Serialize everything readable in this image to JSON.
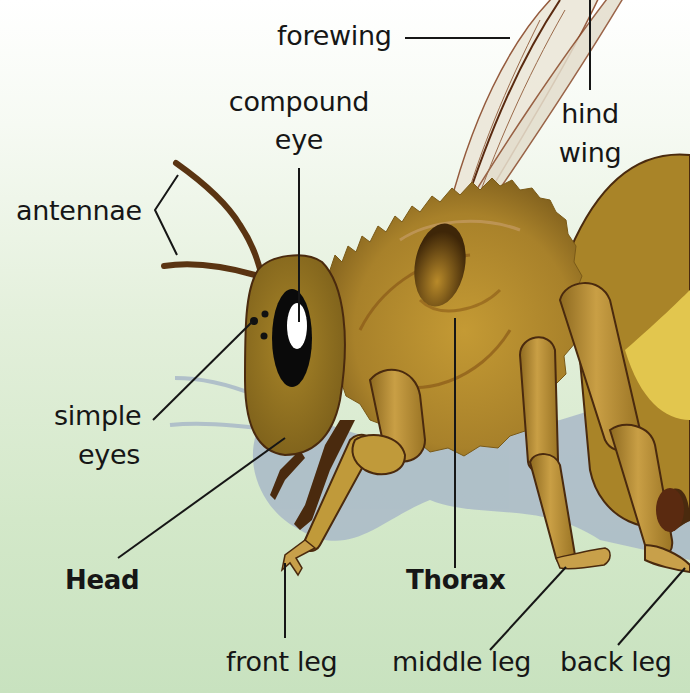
{
  "diagram": {
    "colors": {
      "background_top": "#ffffff",
      "background_bottom": "#c8e2bf",
      "body_gold": "#b08a2c",
      "fur": "#a07a28",
      "outline": "#4a2a0e",
      "wing": "#e9e4d6",
      "shadow": "#a9b9c8",
      "eye": "#000000",
      "leader_line": "#161616"
    },
    "labels": {
      "forewing": "forewing",
      "compound_eye_line1": "compound",
      "compound_eye_line2": "eye",
      "hind_wing_line1": "hind",
      "hind_wing_line2": "wing",
      "antennae": "antennae",
      "simple_eyes_line1": "simple",
      "simple_eyes_line2": "eyes",
      "head": "Head",
      "thorax": "Thorax",
      "front_leg": "front leg",
      "middle_leg": "middle leg",
      "back_leg": "back leg"
    }
  }
}
